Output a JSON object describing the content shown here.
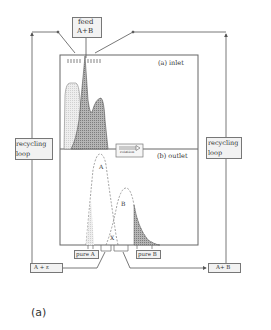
{
  "feed": {
    "line1": "feed",
    "line2": "A+B"
  },
  "panels": {
    "inlet": "(a)  inlet",
    "outlet": "(b)  outlet"
  },
  "recycling_left": {
    "line1": "recycling",
    "line2": "loop"
  },
  "recycling_right": {
    "line1": "recycling",
    "line2": "loop"
  },
  "rotation": {
    "label": "rotation"
  },
  "peaks": {
    "a": "A",
    "b": "B",
    "x": "X"
  },
  "outlets": {
    "pure_a": "pure A",
    "pure_b": "pure B"
  },
  "returns": {
    "left": "A +  ε",
    "right": "A+ B"
  },
  "caption": "(a)",
  "colors": {
    "line": "#555555",
    "light_fill": "#e6e6e6",
    "dark_fill": "#9a9a9a",
    "box_bg": "#f2f2f2"
  }
}
